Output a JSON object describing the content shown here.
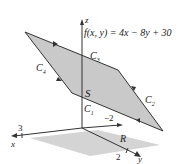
{
  "diagram": {
    "function_label": "f(x, y) = 4x − 8y + 30",
    "surface_label": "S",
    "region_label": "R",
    "curves": [
      "C1",
      "C2",
      "C3",
      "C4"
    ],
    "curve_labels": {
      "c1": "C",
      "c1_sub": "1",
      "c2": "C",
      "c2_sub": "2",
      "c3": "C",
      "c3_sub": "3",
      "c4": "C",
      "c4_sub": "4"
    },
    "axes": {
      "x": "x",
      "y": "y",
      "z": "z"
    },
    "ticks": {
      "x_tick": "3",
      "y_tick": "2",
      "y_neg_tick": "−2"
    },
    "colors": {
      "surface": "#c9c9c9",
      "region": "#d4d4d4",
      "lines": "#333333"
    }
  }
}
